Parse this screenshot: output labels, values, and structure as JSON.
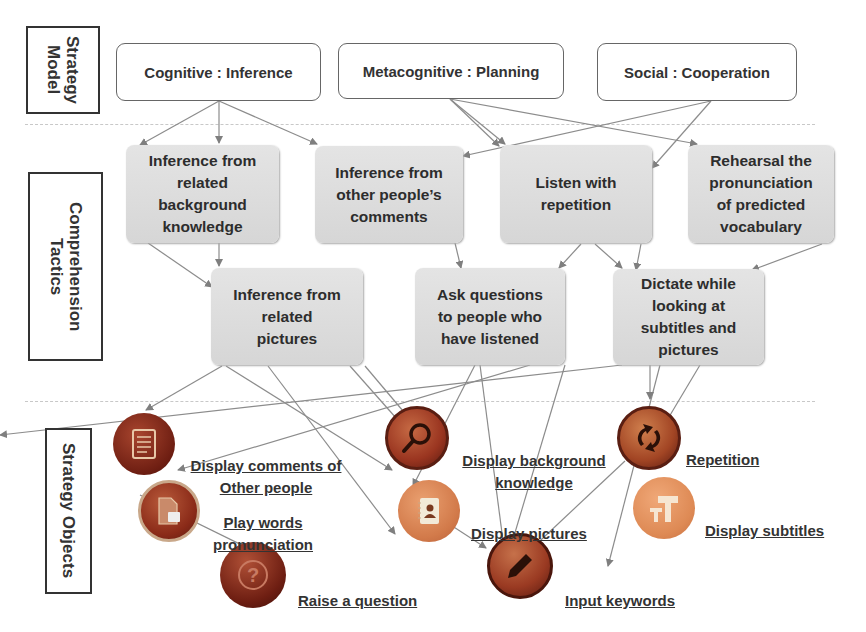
{
  "sections": {
    "strategy_model": "Strategy\nModel",
    "comprehension_tactics": "Comprehension\nTactics",
    "strategy_objects": "Strategy Objects"
  },
  "strategy_model": [
    {
      "id": "cognitive",
      "label": "Cognitive : Inference"
    },
    {
      "id": "metacognitive",
      "label": "Metacognitive : Planning"
    },
    {
      "id": "social",
      "label": "Social : Cooperation"
    }
  ],
  "tactics": [
    {
      "id": "t1",
      "label": "Inference from\nrelated\nbackground\nknowledge"
    },
    {
      "id": "t2",
      "label": "Inference from\nother people’s\ncomments"
    },
    {
      "id": "t3",
      "label": "Listen with\nrepetition"
    },
    {
      "id": "t4",
      "label": "Rehearsal the\npronunciation\nof predicted\nvocabulary"
    },
    {
      "id": "t5",
      "label": "Inference from\nrelated\npictures"
    },
    {
      "id": "t6",
      "label": "Ask questions\nto people who\nhave listened"
    },
    {
      "id": "t7",
      "label": "Dictate while\nlooking at\nsubtitles and\npictures"
    }
  ],
  "objects": [
    {
      "id": "o1",
      "label": "Display comments of\nOther people",
      "icon": "document-list-icon",
      "color": "#8a2a1c"
    },
    {
      "id": "o2",
      "label": "Play words\npronunciation",
      "icon": "audio-file-icon",
      "color": "#9a3020"
    },
    {
      "id": "o3",
      "label": "Raise a question",
      "icon": "question-mark-icon",
      "color": "#7a1f14"
    },
    {
      "id": "o4",
      "label": "Display background\nknowledge",
      "icon": "magnifier-icon",
      "color": "#a23a22"
    },
    {
      "id": "o5",
      "label": "Display pictures",
      "icon": "contact-book-icon",
      "color": "#d87a4a"
    },
    {
      "id": "o6",
      "label": "Input keywords",
      "icon": "pencil-icon",
      "color": "#9e3a22"
    },
    {
      "id": "o7",
      "label": "Repetition",
      "icon": "refresh-arrows-icon",
      "color": "#b04a24"
    },
    {
      "id": "o8",
      "label": "Display subtitles",
      "icon": "text-t-icon",
      "color": "#e08a55"
    }
  ],
  "colors": {
    "tactic_fill": "#dcdcdc",
    "line": "#8a8a8a",
    "object_base": "#9b3522"
  }
}
